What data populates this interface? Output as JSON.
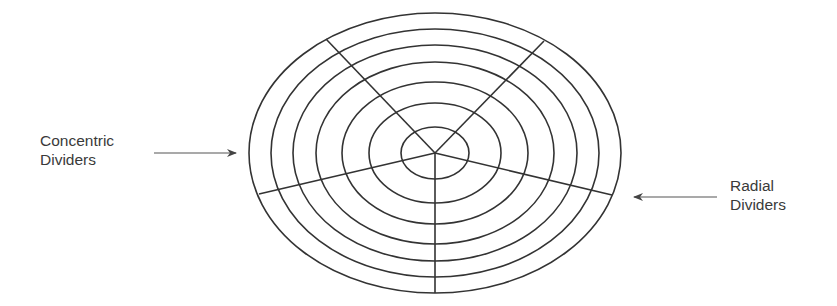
{
  "diagram": {
    "labels": {
      "left": {
        "line1": "Concentric",
        "line2": "Dividers"
      },
      "right": {
        "line1": "Radial",
        "line2": "Dividers"
      }
    },
    "center": {
      "x": 435,
      "y": 153
    },
    "ellipses": [
      {
        "rx": 186,
        "ry": 140
      },
      {
        "rx": 164,
        "ry": 124
      },
      {
        "rx": 142,
        "ry": 108
      },
      {
        "rx": 119,
        "ry": 91
      },
      {
        "rx": 93,
        "ry": 71
      },
      {
        "rx": 66,
        "ry": 50
      },
      {
        "rx": 34,
        "ry": 26
      }
    ],
    "radial_lines": [
      {
        "x": 326,
        "y": 39
      },
      {
        "x": 544,
        "y": 41
      },
      {
        "x": 259,
        "y": 194
      },
      {
        "x": 612,
        "y": 195
      },
      {
        "x": 435,
        "y": 293
      }
    ],
    "stroke_color": "#333333"
  }
}
